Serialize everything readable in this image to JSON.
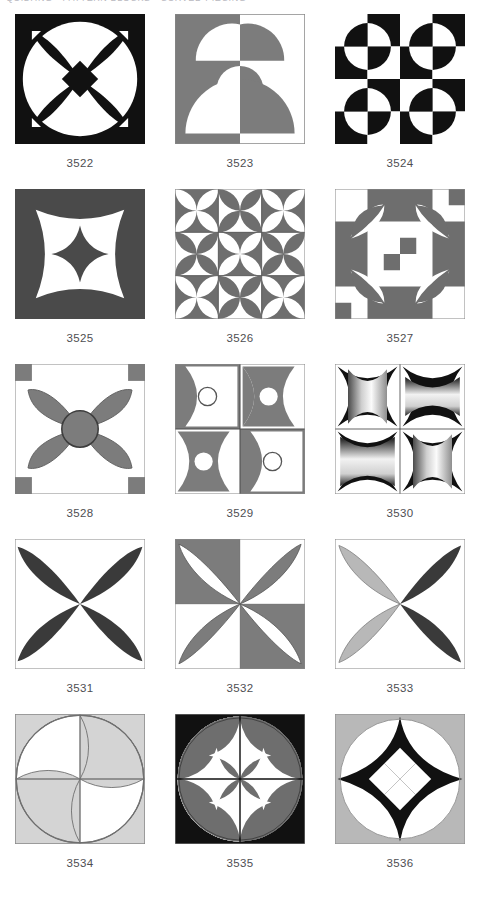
{
  "page": {
    "header_text": "QUILTING • PATTERN BLOCKS • CURVED PIECING",
    "columns": 3,
    "rows": 5
  },
  "palette": {
    "black": "#111111",
    "dark_gray": "#4a4a4a",
    "mid_gray": "#7c7c7c",
    "light_gray": "#b8b8b8",
    "pale_gray": "#d4d4d4",
    "white": "#ffffff",
    "outline": "#8a8a8a",
    "label_color": "#4e4e52",
    "page_background": "#ffffff"
  },
  "blocks": [
    {
      "id": "3522",
      "label": "3522",
      "name": "four-petal-flower-on-circle",
      "description": "Black square with large white circle, black four-petal flower and black center diamond, four small white corner diamonds.",
      "background": "#111111",
      "primary": "#111111",
      "secondary": "#ffffff"
    },
    {
      "id": "3523",
      "label": "3523",
      "name": "stacked-semicircles-split",
      "description": "Square split vertically: left gray, right white. Three stacked semicircles of reversed value straddle the centre line.",
      "background": "#7c7c7c",
      "primary": "#7c7c7c",
      "secondary": "#ffffff"
    },
    {
      "id": "3524",
      "label": "3524",
      "name": "checkerboard-quarter-circles",
      "description": "Four-by-four black and white checkerboard with inverted circles straddling each two-by-two unit.",
      "background": "#111111",
      "primary": "#111111",
      "secondary": "#ffffff"
    },
    {
      "id": "3525",
      "label": "3525",
      "name": "concave-star-with-astroid",
      "description": "Dark gray square, white four-point concave star, dark gray astroid diamond in the centre.",
      "background": "#4a4a4a",
      "primary": "#4a4a4a",
      "secondary": "#ffffff"
    },
    {
      "id": "3526",
      "label": "3526",
      "name": "six-by-six-arc-stars",
      "description": "Six-by-six grid of quarter-circle arc units forming repeated gray concave stars on white.",
      "background": "#ffffff",
      "primary": "#6e6e6e",
      "secondary": "#ffffff"
    },
    {
      "id": "3527",
      "label": "3527",
      "name": "orange-peel-nine-patch",
      "description": "Four-by-four gray and white grid with four gray pointed-oval peels angled toward the centre square.",
      "background": "#ffffff",
      "primary": "#6e6e6e",
      "secondary": "#ffffff"
    },
    {
      "id": "3528",
      "label": "3528",
      "name": "gray-flower-with-center-circle",
      "description": "White square with gray four-petal flower, outlined gray circle at the centre and gray corner squares.",
      "background": "#ffffff",
      "primary": "#7c7c7c",
      "secondary": "#ffffff"
    },
    {
      "id": "3529",
      "label": "3529",
      "name": "concave-pillows-with-dots",
      "description": "Two-by-two concave pillow shapes alternating white and gray, each with a small circle in the centre.",
      "background": "#ffffff",
      "primary": "#7c7c7c",
      "secondary": "#ffffff"
    },
    {
      "id": "3530",
      "label": "3530",
      "name": "shaded-pillows-gradient",
      "description": "Two-by-two concave pillows filled with graded black to white stripes, alternating vertical and horizontal shading.",
      "background": "#ffffff",
      "primary": "#111111",
      "secondary": "#ffffff"
    },
    {
      "id": "3531",
      "label": "3531",
      "name": "black-four-petal-flower",
      "description": "White square with four large black diagonal pointed-oval petals meeting at the centre.",
      "background": "#ffffff",
      "primary": "#3a3a3a",
      "secondary": "#ffffff"
    },
    {
      "id": "3532",
      "label": "3532",
      "name": "reversed-petal-quadrants",
      "description": "Four quadrants with alternating gray and white grounds, each holding a petal in the reversed value.",
      "background": "#ffffff",
      "primary": "#7c7c7c",
      "secondary": "#ffffff"
    },
    {
      "id": "3533",
      "label": "3533",
      "name": "two-tone-petal-flower",
      "description": "White square with four petals: the two left petals light gray, the two right petals dark.",
      "background": "#ffffff",
      "primary": "#3a3a3a",
      "secondary": "#b8b8b8"
    },
    {
      "id": "3534",
      "label": "3534",
      "name": "pinwheel-circle-light",
      "description": "Light gray square with a large circle split into a pinwheel of white and gray curved quarters.",
      "background": "#d4d4d4",
      "primary": "#d4d4d4",
      "secondary": "#ffffff"
    },
    {
      "id": "3535",
      "label": "3535",
      "name": "pinwheel-circle-black",
      "description": "Black square with four gray quarter circles and a white concave star showing through the centre.",
      "background": "#111111",
      "primary": "#6e6e6e",
      "secondary": "#ffffff"
    },
    {
      "id": "3536",
      "label": "3536",
      "name": "astroid-star-checkered-circle",
      "description": "Gray square with white circle, black four-point astroid star containing a white diamond checkerboard.",
      "background": "#b8b8b8",
      "primary": "#111111",
      "secondary": "#ffffff"
    }
  ]
}
